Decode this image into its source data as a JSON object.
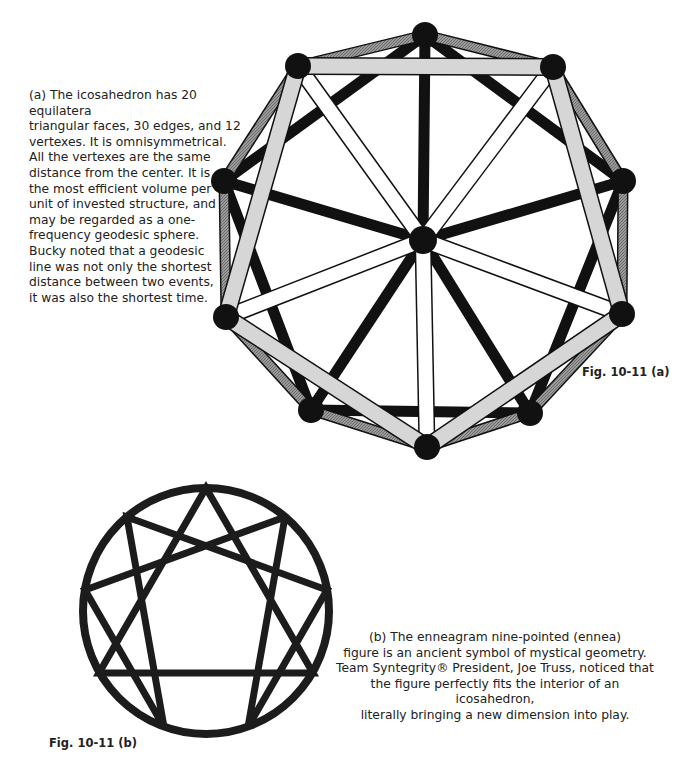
{
  "figure_a": {
    "label": "Fig. 10-11 (a)",
    "caption": "(a) The icosahedron has 20 equilatera\ntriangular faces, 30 edges, and 12\nvertexes. It is omnisymmetrical.\nAll the vertexes are the same\ndistance from the center. It is\nthe most efficient volume per\nunit of invested structure, and\nmay be regarded as a one-\nfrequency geodesic sphere.\nBucky noted that a geodesic\nline was not only the shortest\ndistance between two events,\nit was also the shortest time.",
    "diagram": "icosahedron-projection",
    "colors": {
      "front_strut": "#d4d4d4",
      "side_strut": "#8a8a8a",
      "back_strut": "#111111",
      "radial_strut": "#ffffff",
      "vertex": "#111111"
    }
  },
  "figure_b": {
    "label": "Fig. 10-11 (b)",
    "caption": "(b) The enneagram nine-pointed (ennea)\nfigure is an ancient symbol of mystical geometry.\nTeam Syntegrity® President, Joe Truss, noticed that\nthe figure perfectly fits the interior of an icosahedron,\nliterally bringing a new dimension into play.",
    "diagram": "enneagram",
    "colors": {
      "stroke": "#1c1c1c"
    }
  }
}
